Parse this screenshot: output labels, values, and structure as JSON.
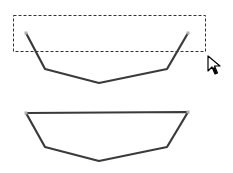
{
  "diagram": {
    "colors": {
      "stroke": "#3a3a3a",
      "endpoint": "#b0b0b0",
      "marquee": "#333333",
      "background": "#ffffff"
    },
    "marquee": {
      "x": 13,
      "y": 15,
      "width": 192,
      "height": 36
    },
    "open_path": {
      "points": "26,33 45,69 99,83 167,69 188,33"
    },
    "closed_path": {
      "points": "26,113 45,147 99,161 167,147 188,112"
    },
    "endpoints_top": [
      [
        26,
        33
      ],
      [
        188,
        33
      ]
    ],
    "endpoints_bottom": [
      [
        26,
        113
      ],
      [
        188,
        112
      ]
    ],
    "cursor": {
      "x": 208,
      "y": 56,
      "icon": "arrow-cursor-icon"
    }
  }
}
